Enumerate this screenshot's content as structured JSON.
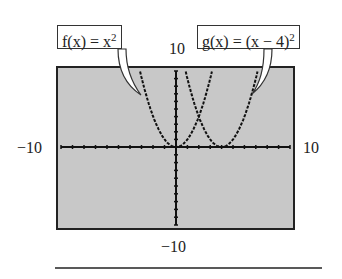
{
  "chart_data": {
    "type": "line",
    "title": "",
    "xlabel": "",
    "ylabel": "",
    "xlim": [
      -10,
      10
    ],
    "ylim": [
      -10,
      10
    ],
    "grid": false,
    "window_labels": {
      "xmin": "−10",
      "xmax": "10",
      "ymin": "−10",
      "ymax": "10"
    },
    "series": [
      {
        "name": "f(x) = x^2",
        "label_prefix": "f(x) = x",
        "exponent": "2",
        "x": [
          -3.16,
          -3,
          -2,
          -1,
          0,
          1,
          2,
          3,
          3.16
        ],
        "y": [
          10,
          9,
          4,
          1,
          0,
          1,
          4,
          9,
          10
        ]
      },
      {
        "name": "g(x) = (x − 4)^2",
        "label_prefix": "g(x) = (x − 4)",
        "exponent": "2",
        "x": [
          0.84,
          1,
          2,
          3,
          4,
          5,
          6,
          7,
          7.16
        ],
        "y": [
          10,
          9,
          4,
          1,
          0,
          1,
          4,
          9,
          10
        ]
      }
    ],
    "intersection": {
      "x": 2,
      "y": 4
    }
  }
}
